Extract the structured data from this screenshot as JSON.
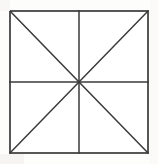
{
  "canvas": {
    "width": 158,
    "height": 164,
    "background_color": "#fdfdfc"
  },
  "figure": {
    "name": "square-with-medians-and-diagonals",
    "stroke_color": "#3a3a3a",
    "fill_color": "#ffffff",
    "stroke_width": 1.5,
    "square": {
      "left": 10,
      "top": 11,
      "right": 148,
      "bottom": 153,
      "width": 138,
      "height": 142
    },
    "center": {
      "x": 79,
      "y": 82
    },
    "vertices": {
      "top_left": [
        10,
        11
      ],
      "top_right": [
        148,
        11
      ],
      "bottom_right": [
        148,
        153
      ],
      "bottom_left": [
        10,
        153
      ],
      "top_mid": [
        79,
        11
      ],
      "right_mid": [
        148,
        82
      ],
      "bottom_mid": [
        79,
        153
      ],
      "left_mid": [
        10,
        82
      ]
    },
    "lines": [
      {
        "name": "vertical-median",
        "x1": 79,
        "y1": 11,
        "x2": 79,
        "y2": 153
      },
      {
        "name": "horizontal-median",
        "x1": 10,
        "y1": 82,
        "x2": 148,
        "y2": 82
      },
      {
        "name": "diagonal-tl-br",
        "x1": 10,
        "y1": 11,
        "x2": 148,
        "y2": 153
      },
      {
        "name": "diagonal-tr-bl",
        "x1": 148,
        "y1": 11,
        "x2": 10,
        "y2": 153
      }
    ],
    "region_count": 8,
    "labels": []
  }
}
